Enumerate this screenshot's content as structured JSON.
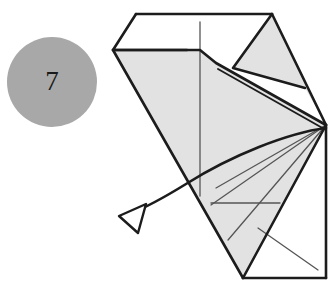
{
  "diagram": {
    "step_label": "7",
    "canvas": {
      "width": 336,
      "height": 308
    },
    "colors": {
      "background": "#ffffff",
      "paper_fill": "#e2e2e2",
      "paper_fill_light": "#ebebeb",
      "outline": "#1c1c1c",
      "fold_line": "#555555",
      "step_circle_fill": "#a8a8a8",
      "step_number": "#1a1a1a",
      "arrow_stroke": "#1c1c1c"
    },
    "step_badge": {
      "label": "7",
      "shape": "circle",
      "center_x": 52,
      "center_y": 82,
      "radius": 45
    },
    "shapes": {
      "left_peak_flap": "136,14 113,50 187,50",
      "right_peak_flap": "272,14 233,68 305,88",
      "main_body": "113,50 200,50 216,63 326,125 243,278 113,50",
      "lower_right_panel": "326,125 326,278 243,278",
      "top_band": "136,14 272,14 216,63 200,50 113,50"
    },
    "outlines": [
      {
        "name": "top-edge",
        "points": "136,14 272,14"
      },
      {
        "name": "left-peak-left-edge",
        "points": "136,14 113,50"
      },
      {
        "name": "left-peak-base",
        "points": "113,50 187,50"
      },
      {
        "name": "right-peak-left-edge",
        "points": "272,14 233,68"
      },
      {
        "name": "right-peak-base",
        "points": "233,68 305,88"
      },
      {
        "name": "right-outer-diagonal",
        "points": "272,14 326,125"
      },
      {
        "name": "upper-horizontal-ledge",
        "points": "113,50 200,50"
      },
      {
        "name": "ledge-step",
        "points": "200,50 216,63"
      },
      {
        "name": "upper-diagonal-to-vertex",
        "points": "216,63 326,125"
      },
      {
        "name": "upper-diagonal-inner",
        "points": "216,68 326,129"
      },
      {
        "name": "left-long-diagonal",
        "points": "113,50 243,278"
      },
      {
        "name": "bottom-left-to-vertex",
        "points": "243,278 326,125"
      },
      {
        "name": "bottom-edge",
        "points": "243,278 326,278"
      },
      {
        "name": "right-vertical-edge",
        "points": "326,125 326,278"
      }
    ],
    "fold_lines": [
      {
        "name": "center-vertical-crease",
        "points": "200,22 200,196"
      },
      {
        "name": "radiating-crease-upper",
        "points": "326,125 216,188"
      },
      {
        "name": "radiating-crease-mid",
        "points": "326,125 211,205"
      },
      {
        "name": "radiating-crease-lower",
        "points": "326,125 228,240"
      },
      {
        "name": "horizontal-crease",
        "points": "211,203 280,203"
      },
      {
        "name": "lower-right-crease",
        "points": "258,228 316,268"
      }
    ],
    "arrow": {
      "name": "fold-direction-arrow",
      "description": "curved arrow sweeping from right vertex down-left, indicating unfold direction",
      "path": "M 326,128 C 288,133 232,155 186,184 C 160,200 142,209 130,213",
      "head_points": "119,216 145,205 138,233",
      "tip_x": 119,
      "tip_y": 216,
      "stroke_width": 2.6
    }
  }
}
